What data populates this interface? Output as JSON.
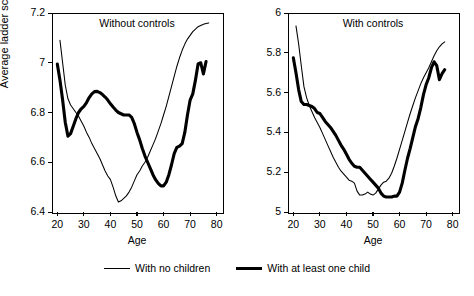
{
  "figure": {
    "ylabel": "Average ladder score",
    "legend": [
      {
        "label": "With no children",
        "style": "thin"
      },
      {
        "label": "With at least one child",
        "style": "thick"
      }
    ]
  },
  "chart_data": [
    {
      "type": "line",
      "title": "Without controls",
      "xlabel": "Age",
      "ylabel": "Average ladder score",
      "xlim": [
        18,
        82
      ],
      "ylim": [
        6.4,
        7.2
      ],
      "xticks": [
        20,
        30,
        40,
        50,
        60,
        70,
        80
      ],
      "yticks": [
        "6.4",
        "6.6",
        "6.8",
        "7",
        "7.2"
      ],
      "grid": false,
      "legend_position": "below-figure",
      "series": [
        {
          "name": "With no children",
          "style": "thin",
          "x": [
            21,
            22,
            23,
            24,
            25,
            26,
            27,
            28,
            29,
            30,
            31,
            32,
            33,
            34,
            35,
            36,
            37,
            38,
            39,
            40,
            41,
            42,
            43,
            44,
            45,
            46,
            47,
            48,
            49,
            50,
            51,
            52,
            53,
            54,
            55,
            56,
            57,
            58,
            59,
            60,
            61,
            62,
            63,
            64,
            65,
            66,
            67,
            68,
            69,
            70,
            71,
            72,
            73,
            74,
            75,
            76,
            77
          ],
          "y": [
            7.09,
            7.0,
            6.91,
            6.855,
            6.83,
            6.815,
            6.8,
            6.785,
            6.765,
            6.745,
            6.72,
            6.7,
            6.675,
            6.655,
            6.635,
            6.615,
            6.59,
            6.565,
            6.545,
            6.53,
            6.5,
            6.465,
            6.44,
            6.445,
            6.455,
            6.465,
            6.48,
            6.5,
            6.525,
            6.55,
            6.565,
            6.585,
            6.6,
            6.62,
            6.645,
            6.67,
            6.695,
            6.725,
            6.755,
            6.79,
            6.825,
            6.865,
            6.905,
            6.945,
            6.985,
            7.02,
            7.05,
            7.075,
            7.095,
            7.11,
            7.125,
            7.135,
            7.145,
            7.15,
            7.155,
            7.158,
            7.16
          ]
        },
        {
          "name": "With at least one child",
          "style": "thick",
          "x": [
            20,
            21,
            22,
            23,
            24,
            25,
            26,
            27,
            28,
            29,
            30,
            31,
            32,
            33,
            34,
            35,
            36,
            37,
            38,
            39,
            40,
            41,
            42,
            43,
            44,
            45,
            46,
            47,
            48,
            49,
            50,
            51,
            52,
            53,
            54,
            55,
            56,
            57,
            58,
            59,
            60,
            61,
            62,
            63,
            64,
            65,
            66,
            67,
            68,
            69,
            70,
            71,
            72,
            73,
            74,
            75,
            76,
            77
          ],
          "y": [
            6.995,
            6.93,
            6.85,
            6.76,
            6.705,
            6.715,
            6.745,
            6.775,
            6.8,
            6.815,
            6.825,
            6.84,
            6.86,
            6.875,
            6.884,
            6.885,
            6.88,
            6.872,
            6.862,
            6.85,
            6.835,
            6.822,
            6.81,
            6.8,
            6.795,
            6.79,
            6.79,
            6.79,
            6.78,
            6.755,
            6.72,
            6.69,
            6.655,
            6.625,
            6.6,
            6.575,
            6.55,
            6.53,
            6.515,
            6.505,
            6.505,
            6.52,
            6.55,
            6.59,
            6.635,
            6.66,
            6.665,
            6.675,
            6.72,
            6.79,
            6.85,
            6.875,
            6.93,
            6.995,
            7.0,
            6.955,
            7.005
          ]
        }
      ]
    },
    {
      "type": "line",
      "title": "With controls",
      "xlabel": "Age",
      "ylabel": "Average ladder score",
      "xlim": [
        18,
        82
      ],
      "ylim": [
        5.0,
        6.0
      ],
      "xticks": [
        20,
        30,
        40,
        50,
        60,
        70,
        80
      ],
      "yticks": [
        "5",
        "5.2",
        "5.4",
        "5.6",
        "5.8",
        "6"
      ],
      "grid": false,
      "legend_position": "below-figure",
      "series": [
        {
          "name": "With no children",
          "style": "thin",
          "x": [
            21,
            22,
            23,
            24,
            25,
            26,
            27,
            28,
            29,
            30,
            31,
            32,
            33,
            34,
            35,
            36,
            37,
            38,
            39,
            40,
            41,
            42,
            43,
            44,
            45,
            46,
            47,
            48,
            49,
            50,
            51,
            52,
            53,
            54,
            55,
            56,
            57,
            58,
            59,
            60,
            61,
            62,
            63,
            64,
            65,
            66,
            67,
            68,
            69,
            70,
            71,
            72,
            73,
            74,
            75,
            76,
            77
          ],
          "y": [
            5.935,
            5.845,
            5.735,
            5.63,
            5.575,
            5.535,
            5.505,
            5.475,
            5.45,
            5.425,
            5.395,
            5.365,
            5.335,
            5.305,
            5.275,
            5.25,
            5.225,
            5.205,
            5.19,
            5.175,
            5.16,
            5.155,
            5.145,
            5.105,
            5.085,
            5.085,
            5.09,
            5.1,
            5.09,
            5.085,
            5.095,
            5.115,
            5.135,
            5.15,
            5.155,
            5.17,
            5.195,
            5.23,
            5.27,
            5.315,
            5.36,
            5.405,
            5.45,
            5.495,
            5.535,
            5.575,
            5.61,
            5.645,
            5.675,
            5.7,
            5.725,
            5.755,
            5.785,
            5.81,
            5.83,
            5.845,
            5.855
          ]
        },
        {
          "name": "With at least one child",
          "style": "thick",
          "x": [
            20,
            21,
            22,
            23,
            24,
            25,
            26,
            27,
            28,
            29,
            30,
            31,
            32,
            33,
            34,
            35,
            36,
            37,
            38,
            39,
            40,
            41,
            42,
            43,
            44,
            45,
            46,
            47,
            48,
            49,
            50,
            51,
            52,
            53,
            54,
            55,
            56,
            57,
            58,
            59,
            60,
            61,
            62,
            63,
            64,
            65,
            66,
            67,
            68,
            69,
            70,
            71,
            72,
            73,
            74,
            75,
            76,
            77
          ],
          "y": [
            5.775,
            5.7,
            5.615,
            5.555,
            5.54,
            5.54,
            5.535,
            5.53,
            5.52,
            5.5,
            5.495,
            5.475,
            5.455,
            5.44,
            5.425,
            5.405,
            5.385,
            5.36,
            5.335,
            5.315,
            5.29,
            5.265,
            5.245,
            5.23,
            5.225,
            5.225,
            5.21,
            5.195,
            5.18,
            5.165,
            5.15,
            5.135,
            5.12,
            5.095,
            5.08,
            5.075,
            5.075,
            5.075,
            5.08,
            5.08,
            5.1,
            5.145,
            5.21,
            5.27,
            5.32,
            5.375,
            5.43,
            5.47,
            5.525,
            5.59,
            5.64,
            5.675,
            5.725,
            5.755,
            5.735,
            5.665,
            5.695,
            5.715
          ]
        }
      ]
    }
  ]
}
